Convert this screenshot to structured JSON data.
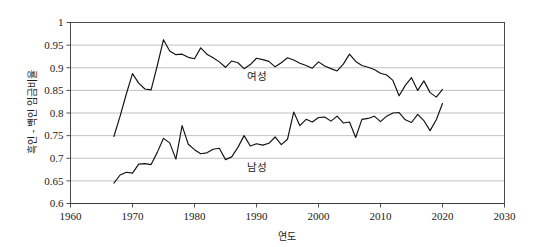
{
  "chart_data": {
    "type": "line",
    "title": "",
    "xlabel": "연도",
    "ylabel": "흑인 - 백인 임금비율",
    "xlim": [
      1960,
      2030
    ],
    "ylim": [
      0.6,
      1
    ],
    "grid": true,
    "legend_position": "inline-annotation",
    "x_ticks": [
      "1960",
      "1970",
      "1980",
      "1990",
      "2000",
      "2010",
      "2020",
      "2030"
    ],
    "y_ticks": [
      "0.6",
      "0.65",
      "0.7",
      "0.75",
      "0.8",
      "0.85",
      "0.9",
      "0.95",
      "1"
    ],
    "annotations": [
      {
        "text": "여성",
        "x": 1990,
        "y": 0.873
      },
      {
        "text": "남성",
        "x": 1990,
        "y": 0.672
      }
    ],
    "series": [
      {
        "name": "여성",
        "color": "#111111",
        "x": [
          1967,
          1968,
          1969,
          1970,
          1971,
          1972,
          1973,
          1974,
          1975,
          1976,
          1977,
          1978,
          1979,
          1980,
          1981,
          1982,
          1983,
          1984,
          1985,
          1986,
          1987,
          1988,
          1989,
          1990,
          1991,
          1992,
          1993,
          1994,
          1995,
          1996,
          1997,
          1998,
          1999,
          2000,
          2001,
          2002,
          2003,
          2004,
          2005,
          2006,
          2007,
          2008,
          2009,
          2010,
          2011,
          2012,
          2013,
          2014,
          2015,
          2016,
          2017,
          2018,
          2019,
          2020
        ],
        "values": [
          0.748,
          0.793,
          0.842,
          0.887,
          0.866,
          0.853,
          0.851,
          0.905,
          0.962,
          0.937,
          0.929,
          0.93,
          0.923,
          0.92,
          0.944,
          0.93,
          0.922,
          0.913,
          0.901,
          0.915,
          0.911,
          0.898,
          0.907,
          0.921,
          0.918,
          0.914,
          0.902,
          0.911,
          0.922,
          0.917,
          0.91,
          0.905,
          0.899,
          0.913,
          0.904,
          0.898,
          0.893,
          0.908,
          0.93,
          0.914,
          0.905,
          0.901,
          0.896,
          0.888,
          0.884,
          0.872,
          0.838,
          0.861,
          0.878,
          0.85,
          0.871,
          0.845,
          0.835,
          0.852
        ]
      },
      {
        "name": "남성",
        "color": "#111111",
        "x": [
          1967,
          1968,
          1969,
          1970,
          1971,
          1972,
          1973,
          1974,
          1975,
          1976,
          1977,
          1978,
          1979,
          1980,
          1981,
          1982,
          1983,
          1984,
          1985,
          1986,
          1987,
          1988,
          1989,
          1990,
          1991,
          1992,
          1993,
          1994,
          1995,
          1996,
          1997,
          1998,
          1999,
          2000,
          2001,
          2002,
          2003,
          2004,
          2005,
          2006,
          2007,
          2008,
          2009,
          2010,
          2011,
          2012,
          2013,
          2014,
          2015,
          2016,
          2017,
          2018,
          2019,
          2020
        ],
        "values": [
          0.645,
          0.663,
          0.669,
          0.667,
          0.687,
          0.688,
          0.686,
          0.713,
          0.744,
          0.734,
          0.698,
          0.772,
          0.731,
          0.719,
          0.71,
          0.712,
          0.72,
          0.722,
          0.697,
          0.703,
          0.724,
          0.75,
          0.727,
          0.732,
          0.729,
          0.733,
          0.747,
          0.73,
          0.742,
          0.802,
          0.772,
          0.786,
          0.78,
          0.79,
          0.791,
          0.782,
          0.793,
          0.778,
          0.78,
          0.746,
          0.786,
          0.788,
          0.793,
          0.781,
          0.793,
          0.8,
          0.801,
          0.785,
          0.779,
          0.797,
          0.783,
          0.761,
          0.785,
          0.821
        ]
      }
    ]
  }
}
